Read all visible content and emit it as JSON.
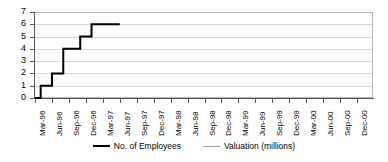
{
  "chart_data": {
    "type": "line",
    "title": "",
    "subtitle": "",
    "xlabel": "",
    "ylabel": "",
    "ylim": [
      0,
      7
    ],
    "ytick_values": [
      0,
      1,
      2,
      3,
      4,
      5,
      6,
      7
    ],
    "ytick_labels": [
      "0",
      "1",
      "2",
      "3",
      "4",
      "5",
      "6",
      "7"
    ],
    "grid": true,
    "grid_orientation": "horizontal",
    "legend_position": "bottom",
    "categories": [
      "Mar-96",
      "Jun-96",
      "Sep-96",
      "Dec-96",
      "Mar-97",
      "Jun-97",
      "Sep-97",
      "Dec-97",
      "Mar-98",
      "Jun-98",
      "Sep-98",
      "Dec-98",
      "Mar-99",
      "Jun-99",
      "Sep-99",
      "Dec-99",
      "Mar-00",
      "Jun-00",
      "Sep-00",
      "Dec-00"
    ],
    "series": [
      {
        "name": "No. of Employees",
        "color": "#000000",
        "line_width": 2,
        "step": true,
        "values": [
          0,
          1,
          2,
          4,
          4,
          5,
          6,
          6,
          6,
          null,
          null,
          null,
          null,
          null,
          null,
          null,
          null,
          null,
          null,
          null
        ],
        "points": [
          {
            "x": "Mar-96",
            "y": 0
          },
          {
            "x": "Apr-96",
            "y": 1
          },
          {
            "x": "May-96",
            "y": 1
          },
          {
            "x": "Jun-96",
            "y": 2
          },
          {
            "x": "Jul-96",
            "y": 2
          },
          {
            "x": "Aug-96",
            "y": 4
          },
          {
            "x": "Oct-96",
            "y": 4
          },
          {
            "x": "Nov-96",
            "y": 5
          },
          {
            "x": "Dec-96",
            "y": 5
          },
          {
            "x": "Jan-97",
            "y": 6
          },
          {
            "x": "Jun-97",
            "y": 6
          }
        ]
      },
      {
        "name": "Valuation (millions)",
        "color": "#9a9a9a",
        "line_width": 1,
        "step": false,
        "values": [
          null,
          null,
          null,
          null,
          null,
          null,
          null,
          null,
          null,
          null,
          null,
          null,
          null,
          null,
          null,
          null,
          null,
          null,
          null,
          null
        ]
      }
    ]
  },
  "legend": {
    "items": [
      {
        "label": "No. of Employees",
        "color": "#000000"
      },
      {
        "label": "Valuation (millions)",
        "color": "#9a9a9a"
      }
    ]
  },
  "colors": {
    "employees": "#000000",
    "valuation": "#9a9a9a",
    "axis": "#555555",
    "grid": "#d6d6d6",
    "plot_border": "#b9b9b9",
    "background": "#ffffff"
  }
}
